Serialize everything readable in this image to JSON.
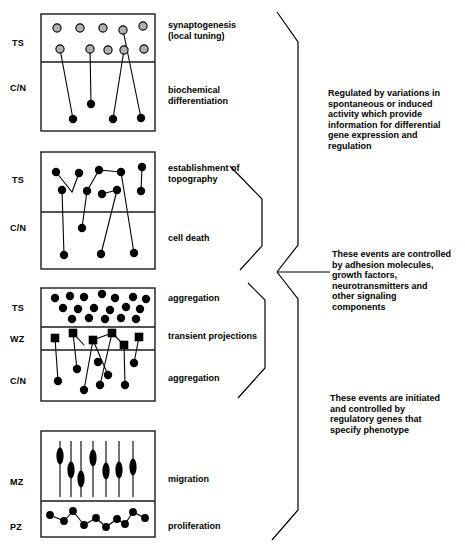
{
  "figure": {
    "title_fragment_top": "",
    "style": {
      "ink": "#000000",
      "panel_border": "#1a1a1a",
      "open_circle_fill": "#b0b0b0",
      "filled_shape": "#000000",
      "background": "#ffffff"
    }
  },
  "panels": [
    {
      "id": "panel-synaptogenesis",
      "zone_labels": [
        "TS",
        "C/N"
      ],
      "stage_labels": [
        "synaptogenesis\n(local tuning)",
        "biochemical\ndifferentiation"
      ],
      "box": {
        "x": 41,
        "y": 14,
        "w": 114,
        "h": 117
      },
      "dividers": [
        62
      ],
      "open_circles": [
        {
          "x": 57,
          "y": 28
        },
        {
          "x": 80,
          "y": 28
        },
        {
          "x": 103,
          "y": 28
        },
        {
          "x": 123,
          "y": 30
        },
        {
          "x": 143,
          "y": 26
        },
        {
          "x": 60,
          "y": 49
        },
        {
          "x": 90,
          "y": 49
        },
        {
          "x": 108,
          "y": 50
        },
        {
          "x": 124,
          "y": 50
        },
        {
          "x": 144,
          "y": 49
        }
      ],
      "filled_circles": [
        {
          "x": 73,
          "y": 119
        },
        {
          "x": 91,
          "y": 104
        },
        {
          "x": 113,
          "y": 119
        },
        {
          "x": 141,
          "y": 118
        }
      ],
      "connections": [
        {
          "from": {
            "x": 60,
            "y": 49
          },
          "to": {
            "x": 73,
            "y": 119
          }
        },
        {
          "from": {
            "x": 90,
            "y": 49
          },
          "to": {
            "x": 91,
            "y": 104
          }
        },
        {
          "from": {
            "x": 124,
            "y": 50
          },
          "to": {
            "x": 113,
            "y": 119
          }
        },
        {
          "from": {
            "x": 123,
            "y": 30
          },
          "to": {
            "x": 141,
            "y": 118
          }
        }
      ]
    },
    {
      "id": "panel-topography",
      "zone_labels": [
        "TS",
        "C/N"
      ],
      "stage_labels": [
        "establishment of\ntopography",
        "cell death"
      ],
      "box": {
        "x": 41,
        "y": 152,
        "w": 114,
        "h": 117
      },
      "dividers": [
        212
      ],
      "filled_circles": [
        {
          "x": 56,
          "y": 172
        },
        {
          "x": 79,
          "y": 173
        },
        {
          "x": 99,
          "y": 170
        },
        {
          "x": 121,
          "y": 172
        },
        {
          "x": 142,
          "y": 167
        },
        {
          "x": 62,
          "y": 190
        },
        {
          "x": 87,
          "y": 191
        },
        {
          "x": 102,
          "y": 194
        },
        {
          "x": 117,
          "y": 190
        },
        {
          "x": 141,
          "y": 191
        },
        {
          "x": 82,
          "y": 228
        },
        {
          "x": 64,
          "y": 255
        },
        {
          "x": 101,
          "y": 254
        },
        {
          "x": 134,
          "y": 253
        }
      ],
      "connections": [
        {
          "from": {
            "x": 56,
            "y": 172
          },
          "to": {
            "x": 72,
            "y": 192
          }
        },
        {
          "from": {
            "x": 72,
            "y": 192
          },
          "to": {
            "x": 79,
            "y": 173
          }
        },
        {
          "from": {
            "x": 62,
            "y": 190
          },
          "to": {
            "x": 64,
            "y": 255
          }
        },
        {
          "from": {
            "x": 87,
            "y": 191
          },
          "to": {
            "x": 99,
            "y": 170
          }
        },
        {
          "from": {
            "x": 87,
            "y": 191
          },
          "to": {
            "x": 82,
            "y": 228
          }
        },
        {
          "from": {
            "x": 99,
            "y": 170
          },
          "to": {
            "x": 121,
            "y": 172
          }
        },
        {
          "from": {
            "x": 102,
            "y": 194
          },
          "to": {
            "x": 117,
            "y": 190
          }
        },
        {
          "from": {
            "x": 117,
            "y": 190
          },
          "to": {
            "x": 101,
            "y": 254
          }
        },
        {
          "from": {
            "x": 121,
            "y": 172
          },
          "to": {
            "x": 134,
            "y": 253
          }
        },
        {
          "from": {
            "x": 142,
            "y": 167
          },
          "to": {
            "x": 141,
            "y": 191
          }
        }
      ]
    },
    {
      "id": "panel-aggregation",
      "zone_labels": [
        "TS",
        "WZ",
        "C/N"
      ],
      "stage_labels": [
        "aggregation",
        "transient projections",
        "aggregation"
      ],
      "box": {
        "x": 41,
        "y": 288,
        "w": 114,
        "h": 113
      },
      "dividers": [
        327,
        350
      ],
      "filled_circles": [
        {
          "x": 55,
          "y": 298
        },
        {
          "x": 70,
          "y": 296
        },
        {
          "x": 84,
          "y": 297
        },
        {
          "x": 102,
          "y": 294
        },
        {
          "x": 115,
          "y": 298
        },
        {
          "x": 133,
          "y": 297
        },
        {
          "x": 146,
          "y": 299
        },
        {
          "x": 63,
          "y": 308
        },
        {
          "x": 78,
          "y": 309
        },
        {
          "x": 94,
          "y": 308
        },
        {
          "x": 110,
          "y": 310
        },
        {
          "x": 126,
          "y": 307
        },
        {
          "x": 140,
          "y": 309
        },
        {
          "x": 72,
          "y": 319
        },
        {
          "x": 89,
          "y": 318
        },
        {
          "x": 105,
          "y": 319
        },
        {
          "x": 121,
          "y": 318
        },
        {
          "x": 136,
          "y": 319
        },
        {
          "x": 58,
          "y": 381
        },
        {
          "x": 77,
          "y": 369
        },
        {
          "x": 84,
          "y": 390
        },
        {
          "x": 98,
          "y": 362
        },
        {
          "x": 100,
          "y": 385
        },
        {
          "x": 108,
          "y": 375
        },
        {
          "x": 125,
          "y": 385
        },
        {
          "x": 134,
          "y": 363
        }
      ],
      "squares": [
        {
          "x": 55,
          "y": 338
        },
        {
          "x": 73,
          "y": 333
        },
        {
          "x": 93,
          "y": 340
        },
        {
          "x": 112,
          "y": 333
        },
        {
          "x": 124,
          "y": 345
        },
        {
          "x": 139,
          "y": 337
        }
      ],
      "connections": [
        {
          "from": {
            "x": 55,
            "y": 338
          },
          "to": {
            "x": 58,
            "y": 381
          }
        },
        {
          "from": {
            "x": 73,
            "y": 333
          },
          "to": {
            "x": 77,
            "y": 369
          }
        },
        {
          "from": {
            "x": 73,
            "y": 333
          },
          "to": {
            "x": 84,
            "y": 345
          }
        },
        {
          "from": {
            "x": 93,
            "y": 340
          },
          "to": {
            "x": 84,
            "y": 390
          }
        },
        {
          "from": {
            "x": 93,
            "y": 340
          },
          "to": {
            "x": 108,
            "y": 375
          }
        },
        {
          "from": {
            "x": 93,
            "y": 340
          },
          "to": {
            "x": 112,
            "y": 333
          }
        },
        {
          "from": {
            "x": 112,
            "y": 333
          },
          "to": {
            "x": 100,
            "y": 385
          }
        },
        {
          "from": {
            "x": 112,
            "y": 333
          },
          "to": {
            "x": 124,
            "y": 345
          }
        },
        {
          "from": {
            "x": 124,
            "y": 345
          },
          "to": {
            "x": 125,
            "y": 385
          }
        },
        {
          "from": {
            "x": 139,
            "y": 337
          },
          "to": {
            "x": 134,
            "y": 363
          }
        }
      ]
    },
    {
      "id": "panel-migration",
      "zone_labels": [
        "MZ",
        "PZ"
      ],
      "stage_labels": [
        "migration",
        "proliferation"
      ],
      "box": {
        "x": 41,
        "y": 431,
        "w": 114,
        "h": 106
      },
      "dividers": [
        501
      ],
      "fibers": [
        {
          "x": 60,
          "y1": 441,
          "y2": 497,
          "cell_y": 456
        },
        {
          "x": 71,
          "y1": 441,
          "y2": 497,
          "cell_y": 470
        },
        {
          "x": 81,
          "y1": 441,
          "y2": 497,
          "cell_y": 479
        },
        {
          "x": 93,
          "y1": 441,
          "y2": 497,
          "cell_y": 458
        },
        {
          "x": 106,
          "y1": 441,
          "y2": 497,
          "cell_y": 471
        },
        {
          "x": 119,
          "y1": 441,
          "y2": 497,
          "cell_y": 470
        },
        {
          "x": 133,
          "y1": 441,
          "y2": 497,
          "cell_y": 467
        }
      ],
      "chain_circles": [
        {
          "x": 50,
          "y": 515
        },
        {
          "x": 64,
          "y": 521
        },
        {
          "x": 73,
          "y": 511
        },
        {
          "x": 84,
          "y": 525
        },
        {
          "x": 96,
          "y": 518
        },
        {
          "x": 106,
          "y": 527
        },
        {
          "x": 117,
          "y": 519
        },
        {
          "x": 125,
          "y": 524
        },
        {
          "x": 133,
          "y": 512
        },
        {
          "x": 145,
          "y": 518
        }
      ],
      "chain_order": [
        0,
        1,
        2,
        3,
        4,
        5,
        6,
        7,
        8,
        9
      ]
    }
  ],
  "notes": [
    {
      "id": "note-activity",
      "text": "Regulated by variations in\nspontaneous or induced\nactivity which provide\ninformation for differential\ngene expression and\nregulation",
      "x": 328,
      "y": 88
    },
    {
      "id": "note-adhesion",
      "text": "These events are controlled\nby adhesion molecules,\ngrowth factors,\nneurotransmitters and\nother signaling\ncomponents",
      "x": 332,
      "y": 249
    },
    {
      "id": "note-regulatory-genes",
      "text": "These events are initiated\nand controlled by\nregulatory genes that\nspecify phenotype",
      "x": 330,
      "y": 393
    }
  ],
  "braces": [
    {
      "id": "brace-upper",
      "points": "277,12 298,42 298,245 277,272"
    },
    {
      "id": "brace-lower",
      "points": "277,272 298,299 298,510 272,540"
    },
    {
      "id": "brace-connector",
      "points": "277,272 330,272"
    },
    {
      "id": "leader-topography",
      "points": "230,166 262,199 262,246 240,270"
    },
    {
      "id": "leader-aggregation",
      "points": "238,398 265,368 265,300 248,283"
    }
  ]
}
